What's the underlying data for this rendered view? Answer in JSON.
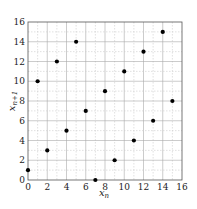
{
  "chart_data": {
    "type": "scatter",
    "title": "",
    "xlabel": "x_n",
    "ylabel": "x_{n+1}",
    "xlim": [
      0,
      16
    ],
    "ylim": [
      0,
      16
    ],
    "xticks": [
      0,
      2,
      4,
      6,
      8,
      10,
      12,
      14,
      16
    ],
    "yticks": [
      0,
      2,
      4,
      6,
      8,
      10,
      12,
      14,
      16
    ],
    "grid": true,
    "legend": null,
    "series": [
      {
        "name": "points",
        "x": [
          0,
          1,
          2,
          3,
          4,
          5,
          6,
          7,
          8,
          9,
          10,
          11,
          12,
          13,
          14,
          15
        ],
        "y": [
          1,
          10,
          3,
          12,
          5,
          14,
          7,
          0,
          9,
          2,
          11,
          4,
          13,
          6,
          15,
          8
        ]
      }
    ]
  },
  "labels": {
    "xlabel_main": "x",
    "xlabel_sub": "n",
    "ylabel_main": "x",
    "ylabel_sub": "n+1"
  }
}
